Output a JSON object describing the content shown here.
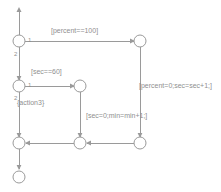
{
  "diagram": {
    "type": "stateflow-flow-chart",
    "canvas": {
      "width": 221,
      "height": 192
    },
    "colors": {
      "line": "#9a9a9a",
      "text": "#8f8f8f",
      "background": "#ffffff"
    }
  },
  "nodes": [
    {
      "id": "entry-arrow",
      "kind": "entry-arrow",
      "x": 19,
      "y": 8
    },
    {
      "id": "junction-1",
      "kind": "junction",
      "x": 19,
      "y": 41,
      "r": 6
    },
    {
      "id": "junction-2",
      "kind": "junction",
      "x": 19,
      "y": 86,
      "r": 6
    },
    {
      "id": "junction-3",
      "kind": "junction",
      "x": 19,
      "y": 143,
      "r": 6
    },
    {
      "id": "junction-4",
      "kind": "junction",
      "x": 80,
      "y": 86,
      "r": 6
    },
    {
      "id": "junction-5",
      "kind": "junction",
      "x": 80,
      "y": 143,
      "r": 6
    },
    {
      "id": "junction-6",
      "kind": "junction",
      "x": 140,
      "y": 41,
      "r": 6
    },
    {
      "id": "junction-7",
      "kind": "junction",
      "x": 140,
      "y": 143,
      "r": 6
    },
    {
      "id": "terminator",
      "kind": "terminator",
      "x": 19,
      "y": 177,
      "r": 6
    }
  ],
  "labels": {
    "percent_eq_100": "[percent==100]",
    "sec_eq_60": "[sec==60]",
    "percent_reset": "[percent=0;sec=sec+1;]",
    "sec_reset": "[sec=0;min=min+1;]",
    "action3": "{action3}"
  },
  "label_parts": {
    "sec_eq_60_bold": "sec",
    "sec_eq_60_rest": "==60]",
    "percent_reset_pre": "[percent=0;se=",
    "percent_reset_bold": "sec",
    "percent_reset_post": "+1;]",
    "sec_reset_bold": "sec",
    "sec_reset_rest": "=0;min=min+1;]"
  },
  "transition_orders": [
    {
      "id": "order-j1-1",
      "value": "1",
      "x": 28,
      "y": 39
    },
    {
      "id": "order-j1-2",
      "value": "2",
      "x": 15,
      "y": 53
    },
    {
      "id": "order-j2-1",
      "value": "1",
      "x": 28,
      "y": 84
    },
    {
      "id": "order-j2-2",
      "value": "2",
      "x": 15,
      "y": 97
    }
  ],
  "edges": [
    {
      "id": "edge-entry",
      "from": "entry-arrow",
      "to": "junction-1"
    },
    {
      "id": "edge-j1-j6",
      "from": "junction-1",
      "to": "junction-6",
      "label": "percent_eq_100"
    },
    {
      "id": "edge-j1-j2",
      "from": "junction-1",
      "to": "junction-2"
    },
    {
      "id": "edge-j2-j4",
      "from": "junction-2",
      "to": "junction-4",
      "label": "sec_eq_60"
    },
    {
      "id": "edge-j2-j3",
      "from": "junction-2",
      "to": "junction-3",
      "label": "action3"
    },
    {
      "id": "edge-j6-j7",
      "from": "junction-6",
      "to": "junction-7",
      "label": "percent_reset"
    },
    {
      "id": "edge-j4-j5",
      "from": "junction-4",
      "to": "junction-5",
      "label": "sec_reset"
    },
    {
      "id": "edge-j7-j5",
      "from": "junction-7",
      "to": "junction-5"
    },
    {
      "id": "edge-j5-j3",
      "from": "junction-5",
      "to": "junction-3"
    },
    {
      "id": "edge-j3-terminator",
      "from": "junction-3",
      "to": "terminator"
    }
  ]
}
